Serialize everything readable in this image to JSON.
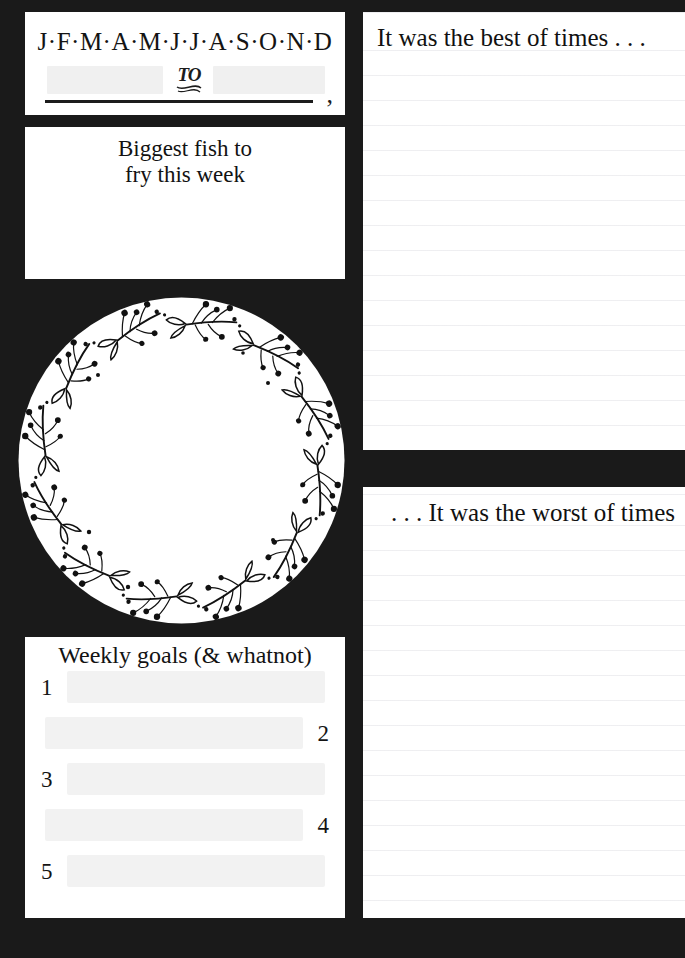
{
  "page": {
    "background_color": "#1a1a1a",
    "card_color": "#ffffff",
    "ink_color": "#141414"
  },
  "date_card": {
    "months_line": "J·F·M·A·M·J·J·A·S·O·N·D",
    "to_label": "TO",
    "trailing_punctuation": ","
  },
  "fish_card": {
    "title_line1": "Biggest fish to",
    "title_line2": "fry this week"
  },
  "wreath": {
    "icon_name": "botanical-wreath-illustration"
  },
  "goals_card": {
    "title": "Weekly goals (& whatnot)",
    "items": [
      {
        "number": "1",
        "align": "left"
      },
      {
        "number": "2",
        "align": "right"
      },
      {
        "number": "3",
        "align": "left"
      },
      {
        "number": "4",
        "align": "right"
      },
      {
        "number": "5",
        "align": "left"
      }
    ]
  },
  "notes": {
    "best": {
      "title": "It was the best of times . . ."
    },
    "worst": {
      "title": ". . . It was the worst of times"
    }
  }
}
